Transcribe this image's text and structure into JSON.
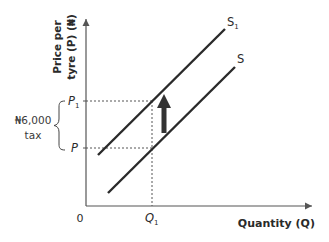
{
  "diagram": {
    "type": "supply-shift-tax",
    "y_axis": {
      "title_line1": "Price per",
      "title_line2": "tyre (P) (₦)"
    },
    "x_axis": {
      "title": "Quantity (Q)"
    },
    "origin_label": "0",
    "price_levels": [
      {
        "label": "P",
        "subscript": "1"
      },
      {
        "label": "P",
        "subscript": ""
      }
    ],
    "quantity_levels": [
      {
        "label": "Q",
        "subscript": "1"
      }
    ],
    "curves": [
      {
        "label": "S",
        "subscript": "1"
      },
      {
        "label": "S",
        "subscript": ""
      }
    ],
    "tax_annotation": {
      "amount": "₦6,000",
      "word": "tax"
    },
    "shift_arrow": {
      "direction": "up"
    },
    "colors": {
      "line": "#2a2a2a",
      "axis": "#555555",
      "dashed": "#555555",
      "arrow": "#333333"
    }
  }
}
